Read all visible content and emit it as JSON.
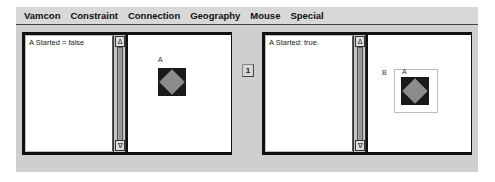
{
  "menubar": {
    "items": [
      "Vamcon",
      "Constraint",
      "Connection",
      "Geography",
      "Mouse",
      "Special"
    ]
  },
  "left_panel": {
    "log_lines": [
      "A Started = false"
    ],
    "scrollbar": {
      "up_glyph": "Δ",
      "down_glyph": "∇"
    },
    "canvas": {
      "nodes": [
        {
          "label": "A",
          "shape": "gray-diamond-on-black-square"
        }
      ]
    }
  },
  "middle_button": {
    "label": "1"
  },
  "right_panel": {
    "log_lines": [
      "A Started: true."
    ],
    "scrollbar": {
      "up_glyph": "Δ",
      "down_glyph": "∇"
    },
    "canvas": {
      "group": {
        "label": "B"
      },
      "nodes": [
        {
          "label": "A",
          "shape": "gray-diamond-on-black-square"
        }
      ]
    }
  },
  "colors": {
    "window_bg": "#cfcfcf",
    "frame_border": "#111111",
    "node_square": "#1a1a1a",
    "node_diamond": "#8c8c8c",
    "pane_bg": "#ffffff"
  }
}
